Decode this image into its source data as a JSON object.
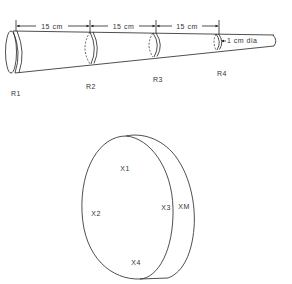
{
  "figure": {
    "background": "#ffffff",
    "line_color": "#222222",
    "text_color": "#333333"
  },
  "cone": {
    "segment_labels": [
      "15 cm",
      "15 cm",
      "15 cm"
    ],
    "tip_label": "1 cm dia",
    "ring_labels": [
      "R1",
      "R2",
      "R3",
      "R4"
    ]
  },
  "disk": {
    "point_labels": [
      "X1",
      "X2",
      "X3",
      "X4"
    ],
    "edge_label": "XM"
  }
}
